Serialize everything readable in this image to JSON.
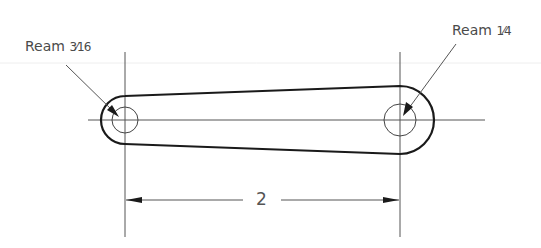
{
  "drawing": {
    "type": "technical-drawing",
    "subject": "link-arm",
    "notes": [
      {
        "id": "left-hole-note",
        "prefix": "Ream",
        "fraction": "3⁄16"
      },
      {
        "id": "right-hole-note",
        "prefix": "Ream",
        "fraction": "1⁄4"
      }
    ],
    "dimension": {
      "value": "2",
      "between": "hole centers"
    },
    "holes": [
      {
        "id": "left",
        "cx": 125,
        "cy": 120,
        "hole_r": 13,
        "boss_r": 24
      },
      {
        "id": "right",
        "cx": 400,
        "cy": 120,
        "hole_r": 16,
        "boss_r": 34
      }
    ],
    "colors": {
      "outline": "#1a1a1a",
      "thin": "#555555",
      "text": "#4a4a4a",
      "background": "#ffffff"
    }
  }
}
